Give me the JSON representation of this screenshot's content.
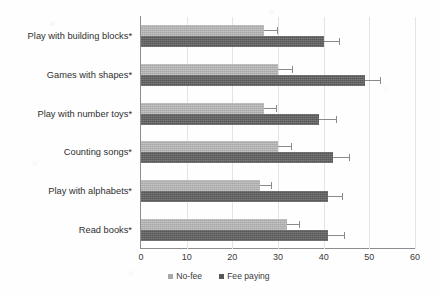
{
  "chart_data": {
    "type": "bar",
    "orientation": "horizontal",
    "title": "",
    "xlabel": "",
    "ylabel": "",
    "xlim": [
      0,
      60
    ],
    "xticks": [
      0,
      10,
      20,
      30,
      40,
      50,
      60
    ],
    "grid": "vertical-only",
    "legend_position": "bottom-center",
    "categories": [
      "Play with building blocks*",
      "Games with shapes*",
      "Play with number toys*",
      "Counting songs*",
      "Play with alphabets*",
      "Read books*"
    ],
    "series": [
      {
        "name": "No-fee",
        "color": "#a8a8a8",
        "values": [
          27,
          30,
          27,
          30,
          26,
          32
        ],
        "errors": [
          2.7,
          3.0,
          2.6,
          2.8,
          2.5,
          2.7
        ]
      },
      {
        "name": "Fee paying",
        "color": "#575757",
        "values": [
          40,
          49,
          39,
          42,
          41,
          41
        ],
        "errors": [
          3.4,
          3.3,
          3.6,
          3.5,
          3.0,
          3.4
        ]
      }
    ],
    "annotations": [
      "Asterisk (*) after each category label denotes statistical significance"
    ]
  },
  "legend": {
    "items": [
      {
        "label": "No-fee",
        "swatch": "nofee-swatch"
      },
      {
        "label": "Fee paying",
        "swatch": "feepaying-swatch"
      }
    ]
  },
  "axis": {
    "xtick_labels": [
      "0",
      "10",
      "20",
      "30",
      "40",
      "50",
      "60"
    ]
  }
}
